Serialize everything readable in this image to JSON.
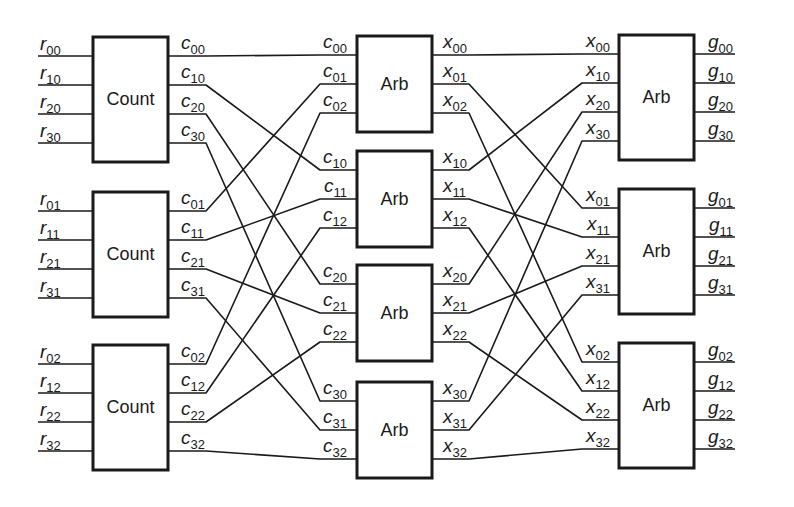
{
  "figure": {
    "stages": [
      {
        "name": "input",
        "block_label": "Count",
        "count": 3
      },
      {
        "name": "middle",
        "block_label": "Arb",
        "count": 4
      },
      {
        "name": "output",
        "block_label": "Arb",
        "count": 3
      }
    ]
  },
  "blocks": {
    "count": [
      {
        "label": "Count",
        "inputs": [
          "r00",
          "r10",
          "r20",
          "r30"
        ],
        "outputs": [
          "c00",
          "c10",
          "c20",
          "c30"
        ]
      },
      {
        "label": "Count",
        "inputs": [
          "r01",
          "r11",
          "r21",
          "r31"
        ],
        "outputs": [
          "c01",
          "c11",
          "c21",
          "c31"
        ]
      },
      {
        "label": "Count",
        "inputs": [
          "r02",
          "r12",
          "r22",
          "r32"
        ],
        "outputs": [
          "c02",
          "c12",
          "c22",
          "c32"
        ]
      }
    ],
    "arb_mid": [
      {
        "label": "Arb",
        "inputs": [
          "c00",
          "c01",
          "c02"
        ],
        "outputs": [
          "x00",
          "x01",
          "x02"
        ]
      },
      {
        "label": "Arb",
        "inputs": [
          "c10",
          "c11",
          "c12"
        ],
        "outputs": [
          "x10",
          "x11",
          "x12"
        ]
      },
      {
        "label": "Arb",
        "inputs": [
          "c20",
          "c21",
          "c22"
        ],
        "outputs": [
          "x20",
          "x21",
          "x22"
        ]
      },
      {
        "label": "Arb",
        "inputs": [
          "c30",
          "c31",
          "c32"
        ],
        "outputs": [
          "x30",
          "x31",
          "x32"
        ]
      }
    ],
    "arb_out": [
      {
        "label": "Arb",
        "inputs": [
          "x00",
          "x10",
          "x20",
          "x30"
        ],
        "outputs": [
          "g00",
          "g10",
          "g20",
          "g30"
        ]
      },
      {
        "label": "Arb",
        "inputs": [
          "x01",
          "x11",
          "x21",
          "x31"
        ],
        "outputs": [
          "g01",
          "g11",
          "g21",
          "g31"
        ]
      },
      {
        "label": "Arb",
        "inputs": [
          "x02",
          "x12",
          "x22",
          "x32"
        ],
        "outputs": [
          "g02",
          "g12",
          "g22",
          "g32"
        ]
      }
    ]
  },
  "connections": {
    "count_to_mid": "c_ij from Count block j output i routes to middle Arb block i input j",
    "mid_to_out": "x_ij from middle Arb block i output j routes to output Arb block j input i"
  }
}
